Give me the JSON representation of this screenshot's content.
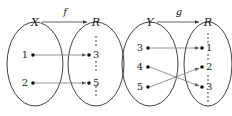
{
  "figure": {
    "background_color": "#ffffff",
    "ink_color": "#1a1a1a",
    "arrow_color": "#7a7a7a"
  },
  "diagrams": [
    {
      "id": "diagram-f",
      "function_name": "f",
      "domain_label": "X",
      "codomain_label": "R",
      "domain_elements": [
        "1",
        "2"
      ],
      "codomain_elements": [
        "3",
        "5"
      ],
      "codomain_has_ellipsis": true,
      "mappings": [
        {
          "from": "1",
          "to": "3"
        },
        {
          "from": "2",
          "to": "5"
        }
      ]
    },
    {
      "id": "diagram-g",
      "function_name": "g",
      "domain_label": "Y",
      "codomain_label": "R",
      "domain_elements": [
        "3",
        "4",
        "5"
      ],
      "codomain_elements": [
        "1",
        "2",
        "3"
      ],
      "codomain_has_ellipsis": true,
      "mappings": [
        {
          "from": "3",
          "to": "1"
        },
        {
          "from": "4",
          "to": "3"
        },
        {
          "from": "5",
          "to": "2"
        }
      ]
    }
  ]
}
